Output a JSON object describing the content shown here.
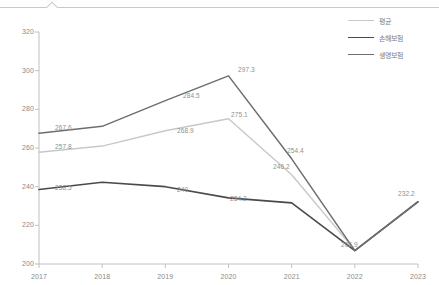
{
  "chart_data": {
    "type": "line",
    "title": "",
    "xlabel": "",
    "ylabel": "",
    "categories": [
      "2017",
      "2018",
      "2019",
      "2020",
      "2021",
      "2022",
      "2023"
    ],
    "ylim": [
      200,
      320
    ],
    "yticks": [
      "200",
      "220",
      "240",
      "260",
      "280",
      "300",
      "320"
    ],
    "grid": false,
    "legend_position": "top-right",
    "series": [
      {
        "name": "평균",
        "color": "#c8c8c8",
        "width": 1.4,
        "values": [
          257.8,
          261.0,
          268.9,
          275.1,
          246.2,
          207.2,
          null
        ],
        "labels": [
          {
            "text": "257.8",
            "index": 0
          },
          {
            "text": "268.9",
            "index": 2
          },
          {
            "text": "275.1",
            "index": 3
          },
          {
            "text": "246.2",
            "index": 4
          }
        ]
      },
      {
        "name": "손해보험",
        "color": "#4a4a4a",
        "width": 1.6,
        "values": [
          238.5,
          242.3,
          240.0,
          234.2,
          231.6,
          206.9,
          232.2
        ],
        "labels": [
          {
            "text": "238.5",
            "index": 0
          },
          {
            "text": "240",
            "index": 2
          },
          {
            "text": "234.2",
            "index": 3
          },
          {
            "text": "206.9",
            "index": 5
          },
          {
            "text": "232.2",
            "index": 6
          }
        ]
      },
      {
        "name": "생명보험",
        "color": "#6e6e6e",
        "width": 1.5,
        "values": [
          267.6,
          271.2,
          284.5,
          297.3,
          254.4,
          206.9,
          232.2
        ],
        "labels": [
          {
            "text": "267.6",
            "index": 0
          },
          {
            "text": "284.5",
            "index": 2
          },
          {
            "text": "297.3",
            "index": 3
          },
          {
            "text": "254.4",
            "index": 4
          }
        ]
      }
    ]
  },
  "axis": {
    "y_ticks": [
      "320",
      "300",
      "280",
      "260",
      "240",
      "220",
      "200"
    ],
    "x_ticks": [
      "2017",
      "2018",
      "2019",
      "2020",
      "2021",
      "2022",
      "2023"
    ]
  },
  "legend": {
    "items": [
      {
        "label": "평균",
        "color": "#c8c8c8"
      },
      {
        "label": "손해보험",
        "color": "#4a4a4a"
      },
      {
        "label": "생명보험",
        "color": "#6e6e6e"
      }
    ]
  },
  "point_labels": [
    {
      "text": "267.6",
      "x": 55,
      "y": 124
    },
    {
      "text": "257.8",
      "x": 55,
      "y": 143
    },
    {
      "text": "238.5",
      "x": 55,
      "y": 184
    },
    {
      "text": "284.5",
      "x": 183,
      "y": 92
    },
    {
      "text": "268.9",
      "x": 177,
      "y": 127
    },
    {
      "text": "240",
      "x": 177,
      "y": 186
    },
    {
      "text": "275.1",
      "x": 231,
      "y": 111
    },
    {
      "text": "297.3",
      "x": 238,
      "y": 66
    },
    {
      "text": "234.2",
      "x": 230,
      "y": 195
    },
    {
      "text": "254.4",
      "x": 287,
      "y": 147
    },
    {
      "text": "246.2",
      "x": 273,
      "y": 163
    },
    {
      "text": "206.9",
      "x": 341,
      "y": 241
    },
    {
      "text": "232.2",
      "x": 398,
      "y": 190
    }
  ],
  "colors": {
    "background": "#ffffff",
    "axis": "#c0c0c0",
    "tick_text": "#8a8a8a",
    "label_text": "#8f8f8f",
    "chrome_rule": "#c9c9c9"
  }
}
